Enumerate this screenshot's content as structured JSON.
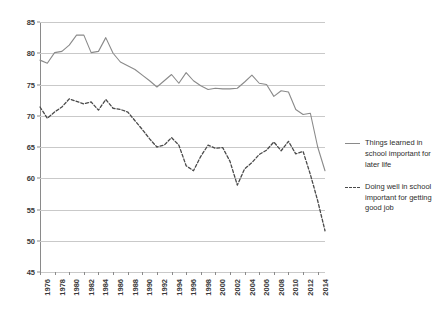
{
  "chart_data": {
    "type": "line",
    "title": "",
    "subtitle": "",
    "xlabel": "",
    "ylabel": "",
    "ylim": [
      45,
      85
    ],
    "xlim": [
      1976,
      2015
    ],
    "grid": true,
    "legend_position": "right",
    "ytick_labels": [
      "85",
      "80",
      "75",
      "70",
      "65",
      "60",
      "55",
      "50",
      "45"
    ],
    "ytick_values": [
      85,
      80,
      75,
      70,
      65,
      60,
      55,
      50,
      45
    ],
    "xtick_labels": [
      "1976",
      "1978",
      "1980",
      "1982",
      "1984",
      "1986",
      "1988",
      "1990",
      "1992",
      "1994",
      "1996",
      "1998",
      "2000",
      "2002",
      "2004",
      "2006",
      "2008",
      "2010",
      "2012",
      "2014"
    ],
    "xtick_values": [
      1976,
      1978,
      1980,
      1982,
      1984,
      1986,
      1988,
      1990,
      1992,
      1994,
      1996,
      1998,
      2000,
      2002,
      2004,
      2006,
      2008,
      2010,
      2012,
      2014
    ],
    "x": [
      1976,
      1977,
      1978,
      1979,
      1980,
      1981,
      1982,
      1983,
      1984,
      1985,
      1986,
      1987,
      1988,
      1989,
      1990,
      1991,
      1992,
      1993,
      1994,
      1995,
      1996,
      1997,
      1998,
      1999,
      2000,
      2001,
      2002,
      2003,
      2004,
      2005,
      2006,
      2007,
      2008,
      2009,
      2010,
      2011,
      2012,
      2013,
      2014,
      2015
    ],
    "series": [
      {
        "name": "Things learned in school important for later life",
        "style": "solid",
        "color": "#8a8a8a",
        "values": [
          78.9,
          78.4,
          80.1,
          80.3,
          81.3,
          82.9,
          82.9,
          80.1,
          80.3,
          82.5,
          80.0,
          78.6,
          78.0,
          77.4,
          76.5,
          75.6,
          74.6,
          75.6,
          76.6,
          75.2,
          76.9,
          75.6,
          74.8,
          74.2,
          74.4,
          74.3,
          74.3,
          74.4,
          75.4,
          76.5,
          75.2,
          75.0,
          73.1,
          74.0,
          73.8,
          71.0,
          70.2,
          70.4,
          65.0,
          61.2
        ]
      },
      {
        "name": "Doing well in school important for getting good job",
        "style": "dashed",
        "color": "#4a4a4a",
        "values": [
          71.4,
          69.6,
          70.6,
          71.4,
          72.7,
          72.3,
          71.9,
          72.2,
          70.9,
          72.6,
          71.2,
          71.0,
          70.6,
          69.2,
          67.8,
          66.3,
          65.0,
          65.3,
          66.5,
          65.3,
          62.0,
          61.2,
          63.5,
          65.3,
          64.8,
          64.9,
          62.7,
          58.9,
          61.5,
          62.5,
          63.8,
          64.5,
          65.8,
          64.4,
          65.9,
          63.9,
          64.3,
          60.6,
          56.4,
          51.6
        ]
      }
    ]
  },
  "legend": {
    "entries": [
      {
        "label": "Things learned in school important for later life",
        "style": "solid"
      },
      {
        "label": "Doing well in school important for getting good job",
        "style": "dashed"
      }
    ]
  }
}
